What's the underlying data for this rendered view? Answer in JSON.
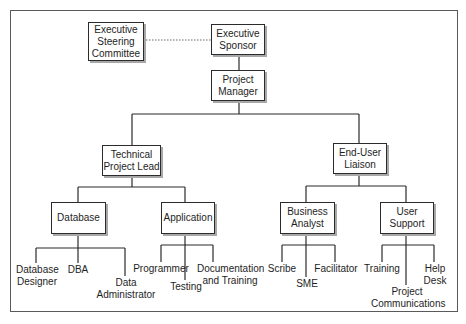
{
  "diagram": {
    "type": "org-chart",
    "nodes": {
      "steering_committee": "Executive\nSteering\nCommittee",
      "sponsor": "Executive\nSponsor",
      "project_manager": "Project\nManager",
      "tech_lead": "Technical\nProject Lead",
      "end_user_liaison": "End-User\nLiaison",
      "database": "Database",
      "application": "Application",
      "business_analyst": "Business\nAnalyst",
      "user_support": "User\nSupport"
    },
    "leaves": {
      "db_designer": "Database\nDesigner",
      "dba": "DBA",
      "data_admin": "Data\nAdministrator",
      "programmer": "Programmer",
      "testing": "Testing",
      "documentation": "Documentation\nand Training",
      "scribe": "Scribe",
      "sme": "SME",
      "facilitator": "Facilitator",
      "training": "Training",
      "project_comms": "Project\nCommunications",
      "help_desk": "Help\nDesk"
    },
    "edges": [
      {
        "from": "steering_committee",
        "to": "sponsor",
        "style": "dotted"
      },
      {
        "from": "sponsor",
        "to": "project_manager"
      },
      {
        "from": "project_manager",
        "to": "tech_lead"
      },
      {
        "from": "project_manager",
        "to": "end_user_liaison"
      },
      {
        "from": "tech_lead",
        "to": "database"
      },
      {
        "from": "tech_lead",
        "to": "application"
      },
      {
        "from": "end_user_liaison",
        "to": "business_analyst"
      },
      {
        "from": "end_user_liaison",
        "to": "user_support"
      },
      {
        "from": "database",
        "to": "db_designer"
      },
      {
        "from": "database",
        "to": "dba"
      },
      {
        "from": "database",
        "to": "data_admin"
      },
      {
        "from": "application",
        "to": "programmer"
      },
      {
        "from": "application",
        "to": "testing"
      },
      {
        "from": "application",
        "to": "documentation"
      },
      {
        "from": "business_analyst",
        "to": "scribe"
      },
      {
        "from": "business_analyst",
        "to": "sme"
      },
      {
        "from": "business_analyst",
        "to": "facilitator"
      },
      {
        "from": "user_support",
        "to": "training"
      },
      {
        "from": "user_support",
        "to": "project_comms"
      },
      {
        "from": "user_support",
        "to": "help_desk"
      }
    ]
  }
}
